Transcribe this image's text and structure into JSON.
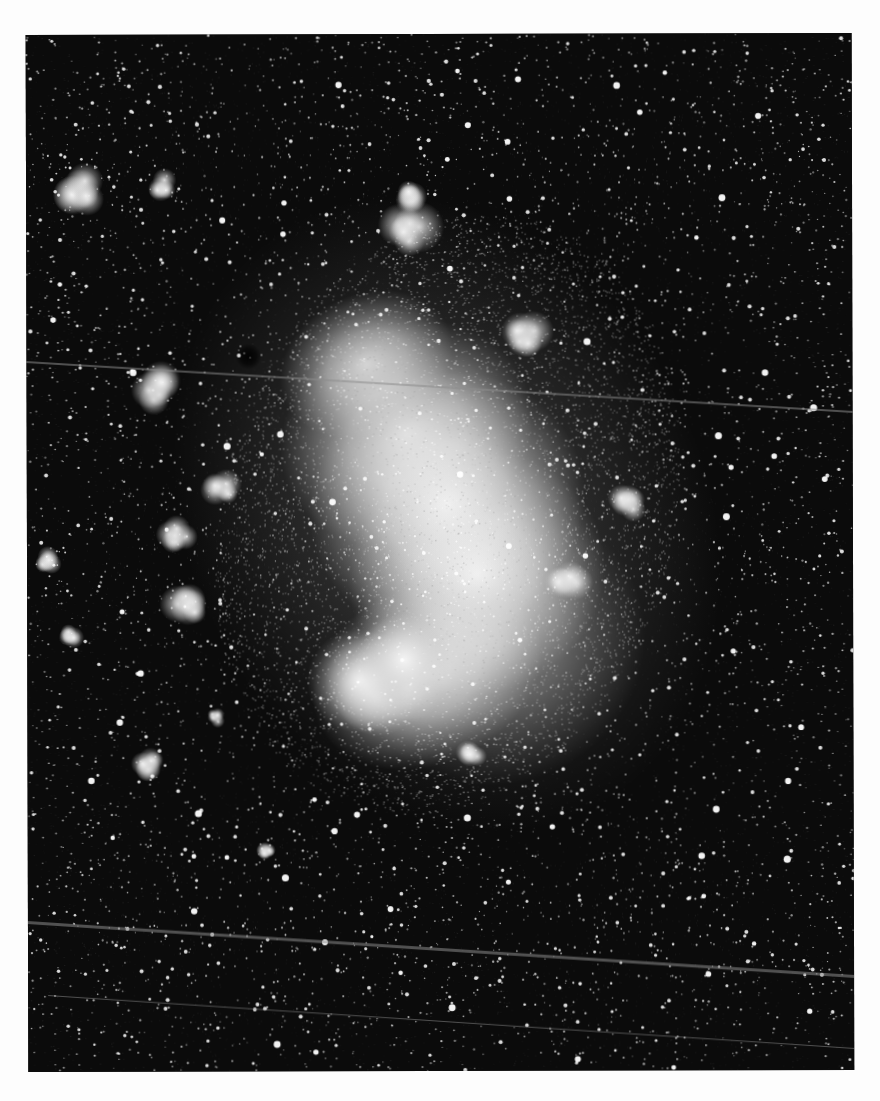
{
  "image": {
    "subject": "Large Magellanic Cloud",
    "kind": "black-and-white astronomical photograph",
    "page_background": "#fdfdfd",
    "photo_background": "#0b0b0b",
    "photo_frame": {
      "left": 27,
      "top": 34,
      "width": 826,
      "height": 1037
    }
  },
  "galaxy_bar": [
    {
      "cx": 340,
      "cy": 330,
      "rx": 90,
      "ry": 70,
      "opacity": 0.8
    },
    {
      "cx": 380,
      "cy": 400,
      "rx": 130,
      "ry": 110,
      "opacity": 0.85
    },
    {
      "cx": 420,
      "cy": 470,
      "rx": 140,
      "ry": 130,
      "opacity": 0.95
    },
    {
      "cx": 450,
      "cy": 540,
      "rx": 130,
      "ry": 120,
      "opacity": 0.9
    },
    {
      "cx": 400,
      "cy": 640,
      "rx": 120,
      "ry": 90,
      "opacity": 0.85
    },
    {
      "cx": 470,
      "cy": 610,
      "rx": 150,
      "ry": 140,
      "opacity": 0.45
    },
    {
      "cx": 420,
      "cy": 480,
      "rx": 260,
      "ry": 330,
      "opacity": 0.22
    }
  ],
  "nebulae": [
    {
      "name": "nebula-upper-left",
      "cx": 55,
      "cy": 155,
      "r": 22
    },
    {
      "name": "nebula-top-small",
      "cx": 135,
      "cy": 150,
      "r": 12
    },
    {
      "name": "nebula-top-center",
      "cx": 385,
      "cy": 200,
      "r": 24
    },
    {
      "name": "nebula-top-center-2",
      "cx": 380,
      "cy": 160,
      "r": 14
    },
    {
      "name": "nebula-left-mid",
      "cx": 130,
      "cy": 355,
      "r": 20
    },
    {
      "name": "nebula-left-1",
      "cx": 195,
      "cy": 455,
      "r": 14
    },
    {
      "name": "nebula-left-2",
      "cx": 150,
      "cy": 500,
      "r": 18
    },
    {
      "name": "nebula-left-3",
      "cx": 160,
      "cy": 570,
      "r": 22
    },
    {
      "name": "nebula-left-4",
      "cx": 20,
      "cy": 525,
      "r": 10
    },
    {
      "name": "nebula-left-5",
      "cx": 45,
      "cy": 600,
      "r": 10
    },
    {
      "name": "nebula-small-ring",
      "cx": 188,
      "cy": 683,
      "r": 8
    },
    {
      "name": "nebula-bottom-left",
      "cx": 120,
      "cy": 730,
      "r": 12
    },
    {
      "name": "nebula-right-1",
      "cx": 540,
      "cy": 545,
      "r": 18
    },
    {
      "name": "nebula-right-2",
      "cx": 600,
      "cy": 470,
      "r": 14
    },
    {
      "name": "nebula-right-upper",
      "cx": 500,
      "cy": 300,
      "r": 22
    },
    {
      "name": "nebula-tarantula",
      "cx": 355,
      "cy": 650,
      "r": 50
    },
    {
      "name": "nebula-bottom-center",
      "cx": 445,
      "cy": 720,
      "r": 12
    },
    {
      "name": "nebula-lower-left-cluster",
      "cx": 240,
      "cy": 815,
      "r": 8
    }
  ],
  "dark_spots": [
    {
      "cx": 222,
      "cy": 322,
      "r": 13
    }
  ],
  "streaks": [
    {
      "x1": 0,
      "y1": 326,
      "x2": 826,
      "y2": 378,
      "width": 1.5
    },
    {
      "x1": 0,
      "y1": 886,
      "x2": 826,
      "y2": 942,
      "width": 2.5
    },
    {
      "x1": 20,
      "y1": 960,
      "x2": 826,
      "y2": 1015,
      "width": 1.2
    }
  ],
  "stars": {
    "count_faint": 5200,
    "count_bright": 650,
    "count_big": 70,
    "seed": 1972
  }
}
